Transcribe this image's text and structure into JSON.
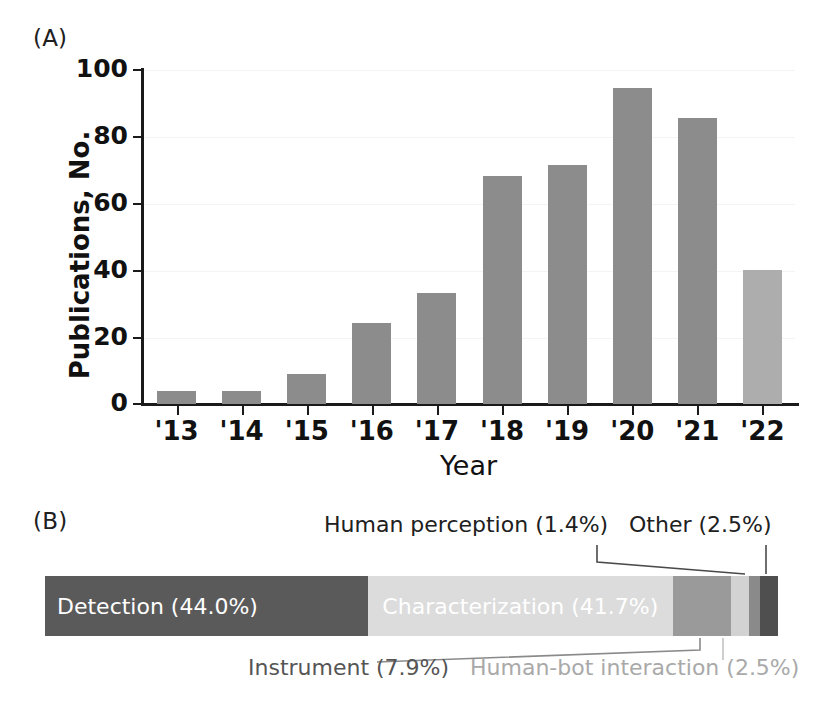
{
  "figure": {
    "panel_a_label": "(A)",
    "panel_b_label": "(B)"
  },
  "chart_data": [
    {
      "type": "bar",
      "panel": "(A)",
      "title": "",
      "xlabel": "Year",
      "ylabel": "Publications, No.",
      "categories": [
        "'13",
        "'14",
        "'15",
        "'16",
        "'17",
        "'18",
        "'19",
        "'20",
        "'21",
        "'22"
      ],
      "values": [
        4,
        4,
        9,
        24,
        33,
        68,
        71,
        94,
        85,
        40
      ],
      "ylim": [
        0,
        100
      ],
      "yticks": [
        "0",
        "20",
        "40",
        "60",
        "80",
        "100"
      ],
      "grid": true,
      "legend": "none",
      "bar_colors": [
        "#8c8c8c",
        "#8c8c8c",
        "#8c8c8c",
        "#8c8c8c",
        "#8c8c8c",
        "#8c8c8c",
        "#8c8c8c",
        "#8c8c8c",
        "#8c8c8c",
        "#adadad"
      ],
      "highlight_note": "last bar ('22) rendered in lighter gray"
    },
    {
      "type": "bar",
      "subtype": "stacked-100-percent",
      "panel": "(B)",
      "title": "",
      "orientation": "horizontal",
      "categories": [
        "Detection",
        "Characterization",
        "Instrument",
        "Human-bot interaction",
        "Human perception",
        "Other"
      ],
      "values": [
        44.0,
        41.7,
        7.9,
        2.5,
        1.4,
        2.5
      ],
      "value_unit": "%",
      "segment_colors": [
        "#5a5a5a",
        "#dcdcdc",
        "#9a9a9a",
        "#d2d2d2",
        "#8a8a8a",
        "#4f4f4f"
      ],
      "segment_label_texts": [
        "Detection (44.0%)",
        "Characterization (41.7%)",
        "Instrument (7.9%)",
        "Human-bot interaction (2.5%)",
        "Human perception (1.4%)",
        "Other (2.5%)"
      ],
      "inside_labels": [
        "Detection (44.0%)",
        "Characterization (41.7%)"
      ],
      "callout_labels": [
        "Human perception (1.4%)",
        "Other (2.5%)",
        "Instrument (7.9%)",
        "Human-bot interaction (2.5%)"
      ],
      "xlim": [
        0,
        100
      ],
      "grid": false,
      "legend": "inline-callouts"
    }
  ],
  "panel_a": {
    "y_axis_title": "Publications, No.",
    "x_axis_title": "Year",
    "y_ticks": [
      "100",
      "80",
      "60",
      "40",
      "20",
      "0"
    ],
    "x_ticks": [
      "'13",
      "'14",
      "'15",
      "'16",
      "'17",
      "'18",
      "'19",
      "'20",
      "'21",
      "'22"
    ],
    "bars": [
      {
        "year": "'13",
        "value": 4
      },
      {
        "year": "'14",
        "value": 4
      },
      {
        "year": "'15",
        "value": 9
      },
      {
        "year": "'16",
        "value": 24
      },
      {
        "year": "'17",
        "value": 33
      },
      {
        "year": "'18",
        "value": 68
      },
      {
        "year": "'19",
        "value": 71
      },
      {
        "year": "'20",
        "value": 94
      },
      {
        "year": "'21",
        "value": 85
      },
      {
        "year": "'22",
        "value": 40
      }
    ]
  },
  "panel_b": {
    "segments": [
      {
        "name": "Detection",
        "pct": 44.0,
        "label": "Detection (44.0%)",
        "color": "#5a5a5a"
      },
      {
        "name": "Characterization",
        "pct": 41.7,
        "label": "Characterization (41.7%)",
        "color": "#dcdcdc"
      },
      {
        "name": "Instrument",
        "pct": 7.9,
        "label": "Instrument (7.9%)",
        "color": "#9a9a9a"
      },
      {
        "name": "Human-bot interaction",
        "pct": 2.5,
        "label": "Human-bot interaction (2.5%)",
        "color": "#d2d2d2"
      },
      {
        "name": "Human perception",
        "pct": 1.4,
        "label": "Human perception (1.4%)",
        "color": "#8a8a8a"
      },
      {
        "name": "Other",
        "pct": 2.5,
        "label": "Other (2.5%)",
        "color": "#4f4f4f"
      }
    ],
    "callouts": {
      "human_perception": "Human perception (1.4%)",
      "other": "Other (2.5%)",
      "instrument": "Instrument (7.9%)",
      "human_bot": "Human-bot interaction (2.5%)"
    }
  },
  "colors": {
    "bar_gray": "#8c8c8c",
    "bar_gray_light": "#adadad",
    "axis": "#1a1a1a",
    "grid": "#f4f4f4"
  }
}
